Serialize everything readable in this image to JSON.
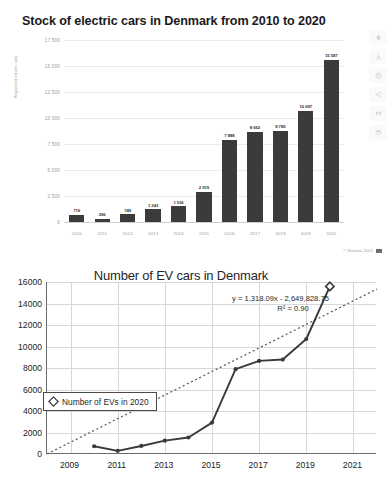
{
  "statista": {
    "title": "Stock of electric cars in Denmark from 2010 to 2020",
    "credit": "© Statista 2021",
    "flag_icon": "flag-icon",
    "rail": [
      {
        "name": "favorite-star-icon",
        "glyph": "star"
      },
      {
        "name": "download-icon",
        "glyph": "download"
      },
      {
        "name": "settings-gear-icon",
        "glyph": "gear"
      },
      {
        "name": "share-icon",
        "glyph": "share"
      },
      {
        "name": "cite-icon",
        "glyph": "quote"
      },
      {
        "name": "print-icon",
        "glyph": "print"
      }
    ],
    "chart_data": {
      "type": "bar",
      "title": "Stock of electric cars in Denmark from 2010 to 2020",
      "xlabel": "",
      "ylabel": "Registered electric cars",
      "categories": [
        "2010",
        "2011",
        "2012",
        "2013",
        "2014",
        "2015",
        "2016",
        "2017",
        "2018",
        "2019",
        "2020"
      ],
      "values": [
        719,
        296,
        749,
        1243,
        1536,
        2919,
        7888,
        8662,
        8785,
        10697,
        15587
      ],
      "value_labels": [
        "719",
        "296",
        "749",
        "1 243",
        "1 536",
        "2 919",
        "7 888",
        "8 662",
        "8 785",
        "10 697",
        "15 587"
      ],
      "yticks": [
        0,
        2500,
        5000,
        7500,
        10000,
        12500,
        15000,
        17500
      ],
      "ytick_labels": [
        "0",
        "2 500",
        "5 000",
        "7 500",
        "10 000",
        "12 500",
        "15 000",
        "17 500"
      ],
      "ylim": [
        0,
        17500
      ],
      "grid": true,
      "legend": "none",
      "bar_color": "#3b3b3b"
    }
  },
  "ev": {
    "chart_data": {
      "type": "line",
      "title": "Number of EV cars in Denmark",
      "xlabel": "",
      "ylabel": "",
      "x": [
        2010,
        2011,
        2012,
        2013,
        2014,
        2015,
        2016,
        2017,
        2018,
        2019,
        2020
      ],
      "values": [
        719,
        296,
        749,
        1243,
        1536,
        2919,
        7888,
        8662,
        8785,
        10697,
        15587
      ],
      "series": [
        {
          "name": "Number of EVs in 2020",
          "x": [
            2010,
            2011,
            2012,
            2013,
            2014,
            2015,
            2016,
            2017,
            2018,
            2019,
            2020
          ],
          "values": [
            719,
            296,
            749,
            1243,
            1536,
            2919,
            7888,
            8662,
            8785,
            10697,
            15587
          ]
        }
      ],
      "trendline": {
        "equation": "y = 1,318.09x - 2,649,828.75",
        "r2_label": "R² = 0.90",
        "slope": 1318.09,
        "intercept": -2649828.75,
        "style": "dotted"
      },
      "yticks": [
        0,
        2000,
        4000,
        6000,
        8000,
        10000,
        12000,
        14000,
        16000
      ],
      "ytick_labels": [
        "0",
        "2000",
        "4000",
        "6000",
        "8000",
        "10000",
        "12000",
        "14000",
        "16000"
      ],
      "ylim": [
        0,
        16000
      ],
      "xticks": [
        2009,
        2011,
        2013,
        2015,
        2017,
        2019,
        2021
      ],
      "xtick_labels": [
        "2009",
        "2011",
        "2013",
        "2015",
        "2017",
        "2019",
        "2021"
      ],
      "xlim": [
        2008,
        2022
      ],
      "grid": true,
      "legend_position": "inside-left",
      "legend_label": "Number of EVs in 2020",
      "marker": "diamond",
      "line_color": "#3a3a3a"
    }
  }
}
